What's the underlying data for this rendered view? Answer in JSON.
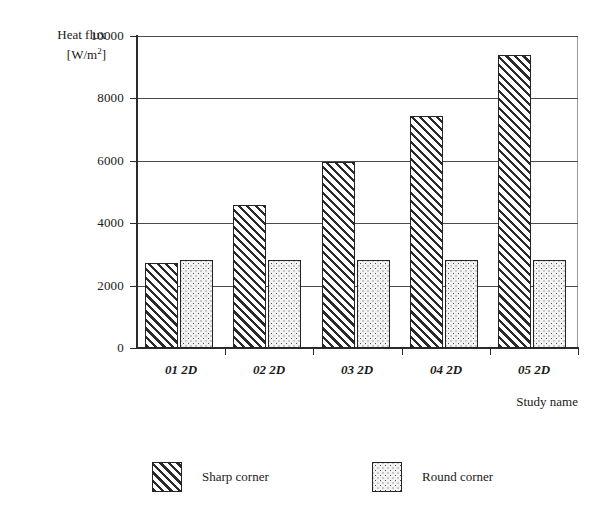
{
  "chart_data": {
    "type": "bar",
    "title": "",
    "subtitle": "",
    "ylabel_line1": "Heat flux",
    "ylabel_line2_prefix": "[W/m",
    "ylabel_line2_sup": "2",
    "ylabel_line2_suffix": "]",
    "ylabel": "Heat flux [W/m2]",
    "xlabel": "Study name",
    "categories": [
      "01 2D",
      "02 2D",
      "03 2D",
      "04 2D",
      "05 2D"
    ],
    "series": [
      {
        "name": "Sharp corner",
        "pattern": "diagonal-hatch",
        "values": [
          2740,
          4570,
          5970,
          7450,
          9400
        ]
      },
      {
        "name": "Round corner",
        "pattern": "dotted",
        "values": [
          2830,
          2830,
          2830,
          2830,
          2830
        ]
      }
    ],
    "ylim": [
      0,
      10000
    ],
    "yticks": [
      0,
      2000,
      4000,
      6000,
      8000,
      10000
    ],
    "ytick_labels": [
      "0",
      "2000",
      "4000",
      "6000",
      "8000",
      "10000"
    ],
    "grid": "horizontal",
    "legend_position": "bottom",
    "legend_entries": [
      "Sharp corner",
      "Round corner"
    ]
  }
}
